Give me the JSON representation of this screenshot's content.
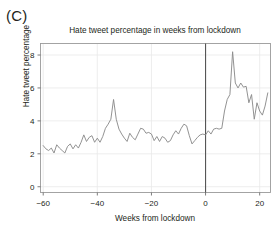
{
  "figure": {
    "panel_label": "(C)"
  },
  "chart_data": {
    "type": "line",
    "title": "Hate tweet percentage in weeks from lockdown",
    "xlabel": "Weeks from lockdown",
    "ylabel": "Hate tweet percentage",
    "xlim": [
      -61,
      24
    ],
    "ylim": [
      -0.35,
      8.7
    ],
    "xticks": [
      -60,
      -40,
      -20,
      0,
      20
    ],
    "xticklabels": [
      "−60",
      "−40",
      "−20",
      "0",
      "20"
    ],
    "yticks": [
      0,
      2,
      4,
      6,
      8
    ],
    "yticklabels": [
      "0",
      "2",
      "4",
      "6",
      "8"
    ],
    "grid": true,
    "legend": "none",
    "line_color": "#8c8c8c",
    "annotations": [
      {
        "type": "vline",
        "x": 0,
        "label": "lockdown",
        "color": "#555555"
      }
    ],
    "series": [
      {
        "name": "Hate tweet percentage",
        "x": [
          -60,
          -59,
          -58,
          -57,
          -56,
          -55,
          -54,
          -53,
          -52,
          -51,
          -50,
          -49,
          -48,
          -47,
          -46,
          -45,
          -44,
          -43,
          -42,
          -41,
          -40,
          -39,
          -38,
          -37,
          -36,
          -35,
          -34,
          -33,
          -32,
          -31,
          -30,
          -29,
          -28,
          -27,
          -26,
          -25,
          -24,
          -23,
          -22,
          -21,
          -20,
          -19,
          -18,
          -17,
          -16,
          -15,
          -14,
          -13,
          -12,
          -11,
          -10,
          -9,
          -8,
          -7,
          -6,
          -5,
          -4,
          -3,
          -2,
          -1,
          0,
          1,
          2,
          3,
          4,
          5,
          6,
          7,
          8,
          9,
          10,
          11,
          12,
          13,
          14,
          15,
          16,
          17,
          18,
          19,
          20,
          21,
          22,
          23
        ],
        "values": [
          2.5,
          2.3,
          2.2,
          2.35,
          2.05,
          2.55,
          2.35,
          2.2,
          2.05,
          2.45,
          2.6,
          2.3,
          2.55,
          2.35,
          2.7,
          3.15,
          2.75,
          3.0,
          3.1,
          2.7,
          2.95,
          2.7,
          3.05,
          3.55,
          3.8,
          4.1,
          5.3,
          4.1,
          3.5,
          3.2,
          2.95,
          2.75,
          3.25,
          3.0,
          2.85,
          3.2,
          3.55,
          3.5,
          3.25,
          3.3,
          3.2,
          2.8,
          3.05,
          2.75,
          3.05,
          2.95,
          2.7,
          2.8,
          3.15,
          3.4,
          3.2,
          3.55,
          3.8,
          3.7,
          3.1,
          2.6,
          2.8,
          3.0,
          3.15,
          3.2,
          3.15,
          3.4,
          3.2,
          3.5,
          3.55,
          3.5,
          3.55,
          4.6,
          5.3,
          5.6,
          8.2,
          6.3,
          6.0,
          6.3,
          6.05,
          6.1,
          5.1,
          5.6,
          4.1,
          5.1,
          4.6,
          4.35,
          4.9,
          5.7
        ]
      }
    ]
  }
}
